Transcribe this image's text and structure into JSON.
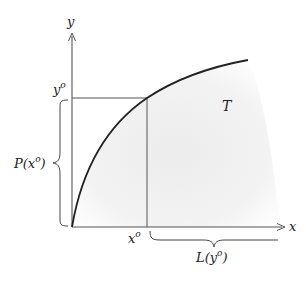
{
  "diagram": {
    "axes": {
      "x_label": "x",
      "y_label": "y"
    },
    "points": {
      "x_o_label": "x",
      "x_o_sup": "o",
      "y_o_label": "y",
      "y_o_sup": "o"
    },
    "region_label": "T",
    "braces": {
      "left": {
        "label_prefix": "P(x",
        "label_sup": "o",
        "label_suffix": ")"
      },
      "bottom": {
        "label_prefix": "L(y",
        "label_sup": "o",
        "label_suffix": ")"
      }
    },
    "colors": {
      "line": "#444444",
      "curve": "#222222",
      "region_fill": "#f1f1f1"
    }
  }
}
